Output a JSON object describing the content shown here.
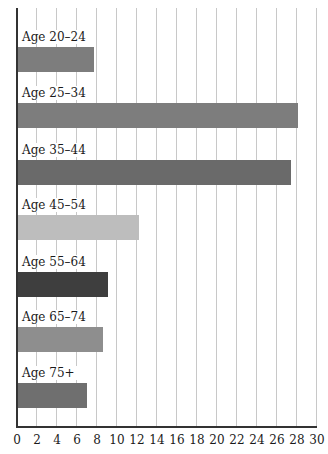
{
  "chart_data": {
    "type": "bar",
    "orientation": "horizontal",
    "title": "",
    "xlabel": "",
    "ylabel": "",
    "categories": [
      "Age 20–24",
      "Age 25–34",
      "Age 35–44",
      "Age 45–54",
      "Age 55–64",
      "Age 65–74",
      "Age 75+"
    ],
    "values": [
      7.7,
      28.1,
      27.4,
      12.2,
      9.1,
      8.6,
      7.0
    ],
    "colors": [
      "#7d7d7d",
      "#7d7d7d",
      "#6a6a6a",
      "#bdbdbd",
      "#3e3e3e",
      "#8e8e8e",
      "#6f6f6f"
    ],
    "xlim": [
      0,
      30
    ],
    "xticks": [
      "0",
      "2",
      "4",
      "6",
      "8",
      "10",
      "12",
      "14",
      "16",
      "18",
      "20",
      "22",
      "24",
      "26",
      "28",
      "30"
    ],
    "grid": true,
    "legend": null
  }
}
